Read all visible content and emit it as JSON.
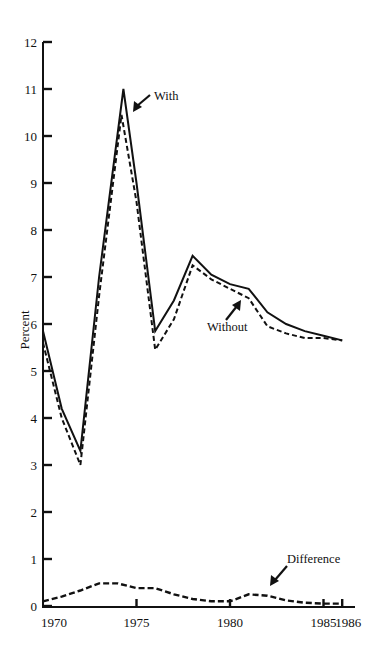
{
  "chart_data": {
    "type": "line",
    "title": "",
    "xlabel": "",
    "ylabel": "Percent",
    "xlim": [
      1970,
      1986
    ],
    "ylim": [
      0,
      12
    ],
    "grid": false,
    "legend": "inline annotations with arrows",
    "x_ticks": [
      1970,
      1975,
      1980,
      1985,
      1986
    ],
    "x_tick_labels": [
      "1970",
      "1975",
      "1980",
      "1985",
      "1986"
    ],
    "y_ticks": [
      0,
      1,
      2,
      3,
      4,
      5,
      6,
      7,
      8,
      9,
      10,
      11,
      12
    ],
    "y_tick_labels": [
      "0",
      "1",
      "2",
      "3",
      "4",
      "5",
      "6",
      "7",
      "8",
      "9",
      "10",
      "11",
      "12"
    ],
    "series": [
      {
        "name": "With",
        "style": "solid",
        "x": [
          1970,
          1971,
          1972,
          1973,
          1974.3,
          1975,
          1976,
          1977,
          1978,
          1979,
          1980,
          1981,
          1982,
          1983,
          1984,
          1985,
          1986
        ],
        "values": [
          5.85,
          4.2,
          3.3,
          7.0,
          11.0,
          9.0,
          5.85,
          6.5,
          7.45,
          7.05,
          6.85,
          6.75,
          6.25,
          6.0,
          5.85,
          5.75,
          5.65
        ]
      },
      {
        "name": "Without",
        "style": "dashed",
        "x": [
          1970,
          1971,
          1972,
          1973,
          1974.2,
          1975,
          1976,
          1977,
          1978,
          1979,
          1980,
          1981,
          1982,
          1983,
          1984,
          1985,
          1986
        ],
        "values": [
          5.6,
          4.0,
          3.0,
          6.6,
          10.45,
          8.6,
          5.45,
          6.1,
          7.25,
          6.95,
          6.75,
          6.55,
          5.95,
          5.8,
          5.7,
          5.7,
          5.65
        ]
      },
      {
        "name": "Difference",
        "style": "dashed",
        "x": [
          1970,
          1971,
          1972,
          1973,
          1974,
          1975,
          1976,
          1977,
          1978,
          1979,
          1980,
          1981,
          1982,
          1983,
          1984,
          1985,
          1986
        ],
        "values": [
          0.1,
          0.2,
          0.33,
          0.48,
          0.48,
          0.38,
          0.38,
          0.25,
          0.15,
          0.1,
          0.1,
          0.25,
          0.22,
          0.12,
          0.07,
          0.05,
          0.05
        ]
      }
    ],
    "annotations": [
      {
        "text": "With",
        "points_to_series": "With",
        "near_x": 1974.6,
        "near_y": 10.5
      },
      {
        "text": "Without",
        "points_to_series": "Without",
        "near_x": 1978.8,
        "near_y": 6.7
      },
      {
        "text": "Difference",
        "points_to_series": "Difference",
        "near_x": 1981.5,
        "near_y": 0.28
      }
    ]
  },
  "labels": {
    "ylabel": "Percent",
    "with": "With",
    "without": "Without",
    "difference": "Difference"
  }
}
